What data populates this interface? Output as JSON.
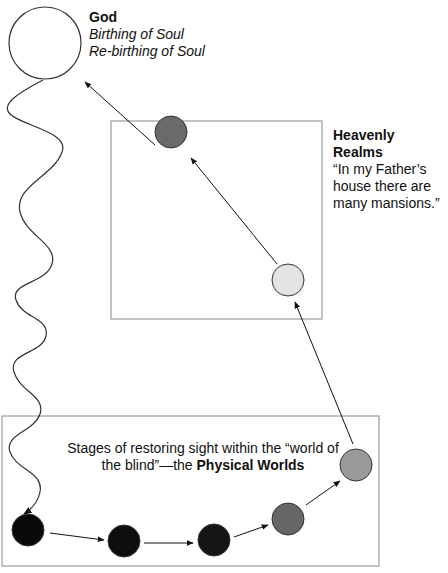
{
  "god": {
    "title": "God",
    "line1": "Birthing of Soul",
    "line2": "Re-birthing of Soul"
  },
  "heavenly": {
    "title": "Heavenly Realms",
    "quote_line1": "“In my Father’s",
    "quote_line2": "house there are",
    "quote_line3": "many mansions.”"
  },
  "physical": {
    "text_part1": "Stages of restoring sight within the “world of the blind”—the ",
    "text_bold": "Physical Worlds"
  },
  "colors": {
    "god_circle": "#ffffff",
    "heaven_light": "#e4e4e4",
    "heaven_dark": "#6a6a6a",
    "phys_1": "#0a0a0a",
    "phys_2": "#0e0e0e",
    "phys_3": "#151515",
    "phys_4": "#666666",
    "phys_5": "#9a9a9a"
  }
}
